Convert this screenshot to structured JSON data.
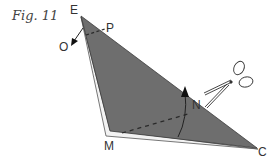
{
  "figure": {
    "title": "Fig. 11"
  },
  "labels": {
    "E": "E",
    "P": "P",
    "O": "O",
    "N": "N",
    "M": "M",
    "C": "C"
  },
  "icons": {
    "scissors": "scissors-icon",
    "fold_arrow_O": "arrow-icon",
    "fold_arrow_N": "arrow-icon"
  },
  "colors": {
    "paper_fill": "#6e6e6e",
    "paper_edge": "#e8e8e8",
    "outline": "#3a3a3a",
    "label": "#333333",
    "background": "#ffffff"
  }
}
